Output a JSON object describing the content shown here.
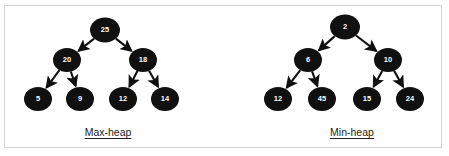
{
  "figure": {
    "background_color": "#ffffff",
    "border_color": "#d4d4d4",
    "node_fill": "#101010",
    "node_text_color": "#ffffff",
    "edge_color": "#101010",
    "caption_color": "#231f20"
  },
  "diagrams": [
    {
      "id": "max-heap",
      "caption": "Max-heap",
      "caption_x": 108,
      "caption_y": 132,
      "nodes": [
        {
          "id": "mx-root",
          "value": "25",
          "cx": 105,
          "cy": 30,
          "rx": 15,
          "ry": 12.5,
          "font_size": 7.5
        },
        {
          "id": "mx-n20",
          "value": "20",
          "cx": 67,
          "cy": 60,
          "rx": 14,
          "ry": 12,
          "font_size": 7.5
        },
        {
          "id": "mx-n18",
          "value": "18",
          "cx": 143,
          "cy": 60,
          "rx": 14,
          "ry": 12,
          "font_size": 7.5
        },
        {
          "id": "mx-n5",
          "value": "5",
          "cx": 38,
          "cy": 99,
          "rx": 14,
          "ry": 12,
          "font_size": 7.5
        },
        {
          "id": "mx-n9",
          "value": "9",
          "cx": 80,
          "cy": 99,
          "rx": 14,
          "ry": 12,
          "font_size": 7.5
        },
        {
          "id": "mx-n12",
          "value": "12",
          "cx": 123,
          "cy": 99,
          "rx": 14,
          "ry": 12,
          "font_size": 7.5
        },
        {
          "id": "mx-n14",
          "value": "14",
          "cx": 165,
          "cy": 99,
          "rx": 14,
          "ry": 12,
          "font_size": 7.5
        }
      ],
      "edges": [
        {
          "from": "mx-root",
          "to": "mx-n20"
        },
        {
          "from": "mx-root",
          "to": "mx-n18"
        },
        {
          "from": "mx-n20",
          "to": "mx-n5"
        },
        {
          "from": "mx-n20",
          "to": "mx-n9"
        },
        {
          "from": "mx-n18",
          "to": "mx-n12"
        },
        {
          "from": "mx-n18",
          "to": "mx-n14"
        }
      ]
    },
    {
      "id": "min-heap",
      "caption": "Min-heap",
      "caption_x": 352,
      "caption_y": 132,
      "nodes": [
        {
          "id": "mn-root",
          "value": "2",
          "cx": 345,
          "cy": 27,
          "rx": 15,
          "ry": 12.5,
          "font_size": 7.5
        },
        {
          "id": "mn-n6",
          "value": "6",
          "cx": 308,
          "cy": 60,
          "rx": 14,
          "ry": 12,
          "font_size": 7.5
        },
        {
          "id": "mn-n10",
          "value": "10",
          "cx": 388,
          "cy": 60,
          "rx": 14,
          "ry": 12,
          "font_size": 7.5
        },
        {
          "id": "mn-n12",
          "value": "12",
          "cx": 278,
          "cy": 99,
          "rx": 14,
          "ry": 12,
          "font_size": 7.5
        },
        {
          "id": "mn-n45",
          "value": "45",
          "cx": 322,
          "cy": 99,
          "rx": 14,
          "ry": 12,
          "font_size": 7.5
        },
        {
          "id": "mn-n15",
          "value": "15",
          "cx": 367,
          "cy": 99,
          "rx": 14,
          "ry": 12,
          "font_size": 7.5
        },
        {
          "id": "mn-n24",
          "value": "24",
          "cx": 410,
          "cy": 99,
          "rx": 14,
          "ry": 12,
          "font_size": 7.5
        }
      ],
      "edges": [
        {
          "from": "mn-root",
          "to": "mn-n6"
        },
        {
          "from": "mn-root",
          "to": "mn-n10"
        },
        {
          "from": "mn-n6",
          "to": "mn-n12"
        },
        {
          "from": "mn-n6",
          "to": "mn-n45"
        },
        {
          "from": "mn-n10",
          "to": "mn-n15"
        },
        {
          "from": "mn-n10",
          "to": "mn-n24"
        }
      ]
    }
  ]
}
